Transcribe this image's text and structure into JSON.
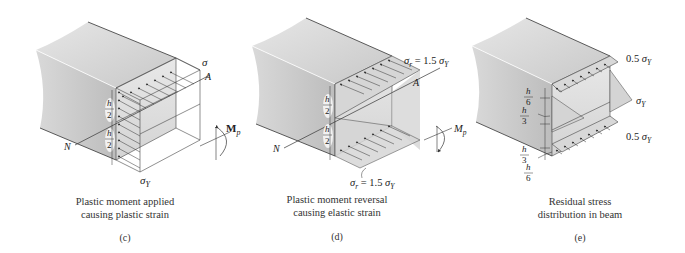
{
  "panels": [
    {
      "id": "c",
      "tag": "(c)",
      "caption_lines": [
        "Plastic moment applied",
        "causing plastic strain"
      ],
      "labels": {
        "stress_top": "σY",
        "stress_bottom": "σY",
        "axis_end": "A",
        "axis_start": "N",
        "half_top": {
          "num": "h",
          "den": "2"
        },
        "half_bottom": {
          "num": "h",
          "den": "2"
        },
        "moment": "Mp"
      }
    },
    {
      "id": "d",
      "tag": "(d)",
      "caption_lines": [
        "Plastic moment reversal",
        "causing elastic strain"
      ],
      "labels": {
        "stress_top": "σr = 1.5 σY",
        "stress_bottom": "σr = 1.5 σY",
        "axis_end": "A",
        "axis_start": "N",
        "half_top": {
          "num": "h",
          "den": "2"
        },
        "half_bottom": {
          "num": "h",
          "den": "2"
        },
        "moment": "Mp"
      }
    },
    {
      "id": "e",
      "tag": "(e)",
      "caption_lines": [
        "Residual stress",
        "distribution in beam"
      ],
      "labels": {
        "stress_top": "0.5 σY",
        "stress_mid": "σY",
        "stress_bottom": "0.5 σY",
        "dim_1": {
          "num": "h",
          "den": "6"
        },
        "dim_2": {
          "num": "h",
          "den": "3"
        },
        "dim_3": {
          "num": "h",
          "den": "3"
        },
        "dim_4": {
          "num": "h",
          "den": "6"
        }
      }
    }
  ],
  "colors": {
    "beam_top": "#d4d4d4",
    "beam_side": "#c4c4c4",
    "section_face": "#e0e0e0",
    "stress_fill": "#d8d8d8",
    "line": "#333333"
  }
}
